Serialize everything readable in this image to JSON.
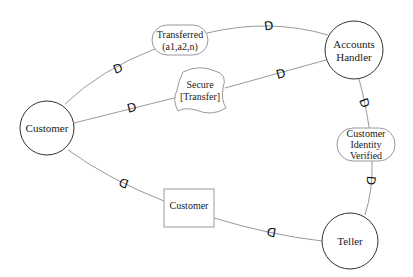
{
  "diagram": {
    "type": "process-flow",
    "nodes": [
      {
        "id": "customer",
        "shape": "circle",
        "label": "Customer",
        "cx": 47,
        "cy": 128,
        "r": 27
      },
      {
        "id": "accounts-handler",
        "shape": "circle",
        "label_lines": [
          "Accounts",
          "Handler"
        ],
        "cx": 354,
        "cy": 50,
        "r": 29
      },
      {
        "id": "teller",
        "shape": "circle",
        "label": "Teller",
        "cx": 350,
        "cy": 241,
        "r": 28
      },
      {
        "id": "transferred",
        "shape": "rounded-oval",
        "label_lines": [
          "Transferred",
          "(a1,a2,n)"
        ]
      },
      {
        "id": "secure-transfer",
        "shape": "cloud",
        "label_lines": [
          "Secure",
          "[Transfer]"
        ]
      },
      {
        "id": "customer-identity-verified",
        "shape": "rounded-oval",
        "label_lines": [
          "Customer",
          "Identity",
          "Verified"
        ]
      },
      {
        "id": "customer-doc",
        "shape": "rectangle",
        "label": "Customer"
      }
    ],
    "edges": [
      {
        "from": "customer",
        "to": "transferred",
        "gate": "D"
      },
      {
        "from": "transferred",
        "to": "accounts-handler",
        "gate": "D"
      },
      {
        "from": "customer",
        "to": "secure-transfer",
        "gate": "D"
      },
      {
        "from": "secure-transfer",
        "to": "accounts-handler",
        "gate": "D"
      },
      {
        "from": "accounts-handler",
        "to": "customer-identity-verified",
        "gate": "D"
      },
      {
        "from": "customer-identity-verified",
        "to": "teller",
        "gate": "D"
      },
      {
        "from": "customer",
        "to": "customer-doc",
        "gate": "D"
      },
      {
        "from": "customer-doc",
        "to": "teller",
        "gate": "D"
      }
    ],
    "gate_glyph": "D",
    "colors": {
      "edge": "#9a9a9a",
      "circle_stroke": "#333333",
      "shape_stroke": "#9a9a9a",
      "text": "#1a1a1a",
      "background": "#ffffff"
    }
  },
  "labels": {
    "customer": "Customer",
    "accounts_handler_1": "Accounts",
    "accounts_handler_2": "Handler",
    "teller": "Teller",
    "transferred_1": "Transferred",
    "transferred_2": "(a1,a2,n)",
    "secure_1": "Secure",
    "secure_2": "[Transfer]",
    "civ_1": "Customer",
    "civ_2": "Identity",
    "civ_3": "Verified",
    "customer_doc": "Customer",
    "gate": "D"
  }
}
